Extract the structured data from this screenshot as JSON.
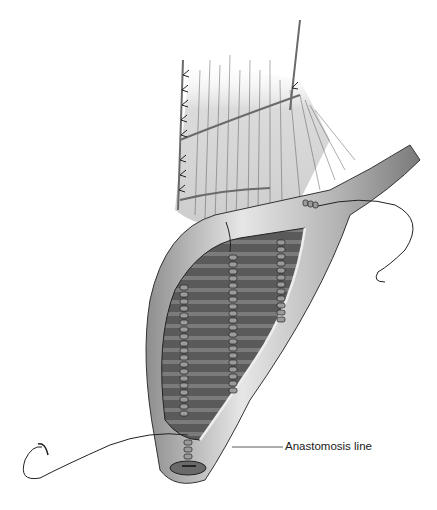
{
  "figure": {
    "labels": [
      {
        "text": "Anastomosis line"
      }
    ]
  },
  "colors": {
    "background": "#ffffff",
    "ink": "#1a1a1a",
    "bowel_light": "#d8d8d8",
    "bowel_mid": "#a9a9a9",
    "lumen_dark": "#5e5e5e"
  }
}
